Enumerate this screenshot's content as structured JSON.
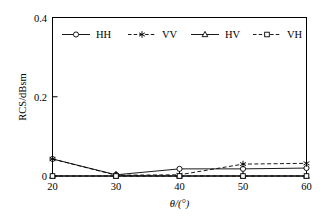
{
  "chart_data": {
    "type": "line",
    "title": "",
    "subtitle": "",
    "xlabel": "θ/(°)",
    "ylabel": "RCS/dBsm",
    "x": [
      20,
      30,
      40,
      50,
      60
    ],
    "xlim": [
      20,
      60
    ],
    "ylim": [
      0,
      0.4
    ],
    "xticks": [
      20,
      30,
      40,
      50,
      60
    ],
    "xtick_labels": [
      "20",
      "30",
      "40",
      "50",
      "60"
    ],
    "yticks": [
      0,
      0.2,
      0.4
    ],
    "ytick_labels": [
      "0",
      "0.2",
      "0.4"
    ],
    "grid": false,
    "legend_position": "top-inside",
    "series": [
      {
        "name": "HH",
        "values": [
          0.043,
          0.003,
          0.018,
          0.018,
          0.02
        ],
        "linestyle": "solid",
        "marker": "circle",
        "color": "#000000"
      },
      {
        "name": "VV",
        "values": [
          0.043,
          0.002,
          0.003,
          0.03,
          0.032
        ],
        "linestyle": "dashed",
        "marker": "star",
        "color": "#000000"
      },
      {
        "name": "HV",
        "values": [
          0.0,
          0.0,
          0.0,
          0.0,
          0.0
        ],
        "linestyle": "solid",
        "marker": "triangle",
        "color": "#000000"
      },
      {
        "name": "VH",
        "values": [
          0.0,
          0.0,
          0.0,
          0.0,
          0.0
        ],
        "linestyle": "dashed",
        "marker": "square",
        "color": "#000000"
      }
    ]
  },
  "legend": {
    "items": [
      {
        "label": "HH",
        "marker": "circle-marker",
        "linestyle": "solid"
      },
      {
        "label": "VV",
        "marker": "star-marker",
        "linestyle": "dashed"
      },
      {
        "label": "HV",
        "marker": "triangle-marker",
        "linestyle": "solid"
      },
      {
        "label": "VH",
        "marker": "square-marker",
        "linestyle": "dashed"
      }
    ]
  },
  "axes": {
    "y_title": "RCS/dBsm",
    "x_title": "θ/(°)",
    "y_tick_0": "0",
    "y_tick_1": "0.2",
    "y_tick_2": "0.4",
    "x_tick_0": "20",
    "x_tick_1": "30",
    "x_tick_2": "40",
    "x_tick_3": "50",
    "x_tick_4": "60"
  }
}
